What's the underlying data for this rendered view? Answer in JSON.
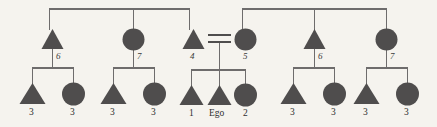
{
  "diagram": {
    "type": "pedigree",
    "background_color": "#f5f3ee",
    "symbol_fill_color": "#4f4d4d",
    "line_color": "#6e6c6c",
    "generations": 3
  },
  "generation1": {
    "sibship_bars": [
      {
        "name": "left-descent-bar",
        "left": 49,
        "right": 190,
        "y": 9,
        "drop_x": [
          49,
          133,
          190
        ]
      },
      {
        "name": "right-descent-bar",
        "left": 242,
        "right": 387,
        "y": 9,
        "drop_x": [
          242,
          314,
          387
        ]
      }
    ]
  },
  "generation2": {
    "members": [
      {
        "id": "g2-1",
        "shape": "triangle",
        "label": "6",
        "cx": 52,
        "cy": 40
      },
      {
        "id": "g2-2",
        "shape": "circle",
        "label": "7",
        "cx": 133,
        "cy": 40
      },
      {
        "id": "g2-3",
        "shape": "triangle",
        "label": "4",
        "cx": 193,
        "cy": 40
      },
      {
        "id": "g2-4",
        "shape": "circle",
        "label": "5",
        "cx": 245,
        "cy": 40
      },
      {
        "id": "g2-5",
        "shape": "triangle",
        "label": "6",
        "cx": 314,
        "cy": 40
      },
      {
        "id": "g2-6",
        "shape": "circle",
        "label": "7",
        "cx": 387,
        "cy": 40
      }
    ],
    "marriage": {
      "name": "marriage-equals-sign",
      "between": [
        "g2-3",
        "g2-4"
      ],
      "x1": 209,
      "x2": 229,
      "y_top": 35,
      "y_bottom": 42
    }
  },
  "generation3": {
    "families": [
      {
        "name": "family-left-a",
        "parent": "g2-1",
        "bar_y": 68,
        "bar_left": 32,
        "bar_right": 74,
        "children": [
          {
            "id": "g3-1",
            "shape": "triangle",
            "label": "3",
            "cx": 32,
            "cy": 94
          },
          {
            "id": "g3-2",
            "shape": "circle",
            "label": "3",
            "cx": 74,
            "cy": 94
          }
        ]
      },
      {
        "name": "family-left-b",
        "parent": "g2-2",
        "bar_y": 68,
        "bar_left": 113,
        "bar_right": 155,
        "children": [
          {
            "id": "g3-3",
            "shape": "triangle",
            "label": "3",
            "cx": 113,
            "cy": 94
          },
          {
            "id": "g3-4",
            "shape": "circle",
            "label": "3",
            "cx": 155,
            "cy": 94
          }
        ]
      },
      {
        "name": "family-ego",
        "parent": "marriage",
        "bar_y": 70,
        "bar_left": 191,
        "bar_right": 246,
        "children": [
          {
            "id": "g3-5",
            "shape": "triangle",
            "label": "1",
            "cx": 191,
            "cy": 96
          },
          {
            "id": "g3-6",
            "shape": "triangle",
            "label": "Ego",
            "cx": 219,
            "cy": 96
          },
          {
            "id": "g3-7",
            "shape": "circle",
            "label": "2",
            "cx": 246,
            "cy": 96
          }
        ]
      },
      {
        "name": "family-right-a",
        "parent": "g2-5",
        "bar_y": 68,
        "bar_left": 293,
        "bar_right": 335,
        "children": [
          {
            "id": "g3-8",
            "shape": "triangle",
            "label": "3",
            "cx": 293,
            "cy": 94
          },
          {
            "id": "g3-9",
            "shape": "circle",
            "label": "3",
            "cx": 335,
            "cy": 94
          }
        ]
      },
      {
        "name": "family-right-b",
        "parent": "g2-6",
        "bar_y": 68,
        "bar_left": 366,
        "bar_right": 408,
        "children": [
          {
            "id": "g3-10",
            "shape": "triangle",
            "label": "3",
            "cx": 366,
            "cy": 94
          },
          {
            "id": "g3-11",
            "shape": "circle",
            "label": "3",
            "cx": 408,
            "cy": 94
          }
        ]
      }
    ]
  },
  "labels": {
    "gen2": {
      "n1": "6",
      "n2": "7",
      "n3": "4",
      "n4": "5",
      "n5": "6",
      "n6": "7"
    },
    "gen3": {
      "c1": "3",
      "c2": "3",
      "c3": "3",
      "c4": "3",
      "c5": "1",
      "ego": "Ego",
      "c7": "2",
      "c8": "3",
      "c9": "3",
      "c10": "3",
      "c11": "3"
    }
  }
}
